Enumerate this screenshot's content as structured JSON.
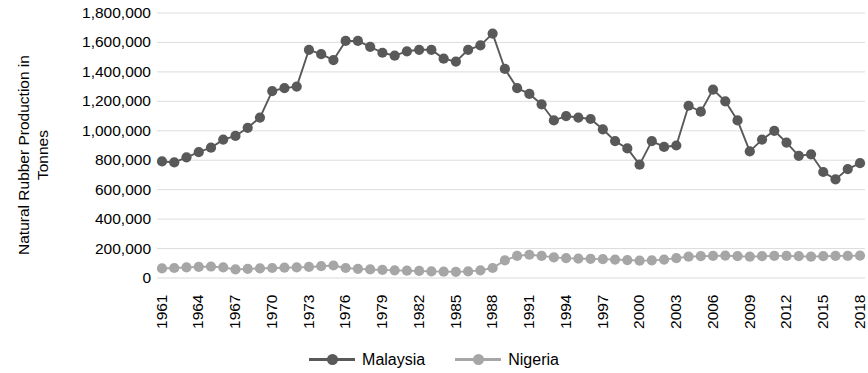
{
  "chart_data": {
    "type": "line",
    "title": "",
    "xlabel": "",
    "ylabel": "Natural Rubber Production in Tonnes",
    "ylabel_lines": [
      "Natural Rubber Production in",
      "Tonnes"
    ],
    "ylim": [
      0,
      1800000
    ],
    "ytick_step": 200000,
    "ytick_labels": [
      "1,800,000",
      "1,600,000",
      "1,400,000",
      "1,200,000",
      "1,000,000",
      "800,000",
      "600,000",
      "400,000",
      "200,000",
      "0"
    ],
    "ytick_values": [
      1800000,
      1600000,
      1400000,
      1200000,
      1000000,
      800000,
      600000,
      400000,
      200000,
      0
    ],
    "grid": "horizontal",
    "grid_color": "#D9D9D9",
    "legend_position": "bottom",
    "xlim": [
      1961,
      2018
    ],
    "xtick_interval": 3,
    "xtick_labels": [
      "1961",
      "1964",
      "1967",
      "1970",
      "1973",
      "1976",
      "1979",
      "1982",
      "1985",
      "1988",
      "1991",
      "1994",
      "1997",
      "2000",
      "2003",
      "2006",
      "2009",
      "2012",
      "2015",
      "2018"
    ],
    "x": [
      1961,
      1962,
      1963,
      1964,
      1965,
      1966,
      1967,
      1968,
      1969,
      1970,
      1971,
      1972,
      1973,
      1974,
      1975,
      1976,
      1977,
      1978,
      1979,
      1980,
      1981,
      1982,
      1983,
      1984,
      1985,
      1986,
      1987,
      1988,
      1989,
      1990,
      1991,
      1992,
      1993,
      1994,
      1995,
      1996,
      1997,
      1998,
      1999,
      2000,
      2001,
      2002,
      2003,
      2004,
      2005,
      2006,
      2007,
      2008,
      2009,
      2010,
      2011,
      2012,
      2013,
      2014,
      2015,
      2016,
      2017,
      2018
    ],
    "series": [
      {
        "name": "Malaysia",
        "color": "#595959",
        "marker": "circle",
        "values": [
          792000,
          785000,
          820000,
          855000,
          885000,
          940000,
          965000,
          1020000,
          1090000,
          1270000,
          1290000,
          1300000,
          1550000,
          1520000,
          1480000,
          1610000,
          1610000,
          1570000,
          1530000,
          1510000,
          1540000,
          1550000,
          1550000,
          1490000,
          1470000,
          1550000,
          1580000,
          1660000,
          1420000,
          1290000,
          1250000,
          1180000,
          1070000,
          1100000,
          1090000,
          1080000,
          1010000,
          930000,
          880000,
          770000,
          930000,
          890000,
          900000,
          1170000,
          1130000,
          1280000,
          1200000,
          1070000,
          860000,
          940000,
          1000000,
          920000,
          830000,
          840000,
          720000,
          670000,
          740000,
          780000
        ]
      },
      {
        "name": "Nigeria",
        "color": "#A6A6A6",
        "marker": "circle",
        "values": [
          65000,
          68000,
          72000,
          75000,
          78000,
          72000,
          58000,
          62000,
          65000,
          68000,
          70000,
          72000,
          75000,
          80000,
          85000,
          68000,
          62000,
          58000,
          55000,
          52000,
          50000,
          48000,
          45000,
          43000,
          42000,
          45000,
          52000,
          68000,
          120000,
          150000,
          158000,
          150000,
          140000,
          135000,
          132000,
          130000,
          128000,
          125000,
          122000,
          118000,
          120000,
          125000,
          135000,
          145000,
          148000,
          150000,
          152000,
          148000,
          145000,
          148000,
          150000,
          150000,
          148000,
          145000,
          148000,
          150000,
          150000,
          152000
        ]
      }
    ]
  },
  "legend": {
    "items": [
      {
        "label": "Malaysia",
        "color": "#595959"
      },
      {
        "label": "Nigeria",
        "color": "#A6A6A6"
      }
    ]
  }
}
